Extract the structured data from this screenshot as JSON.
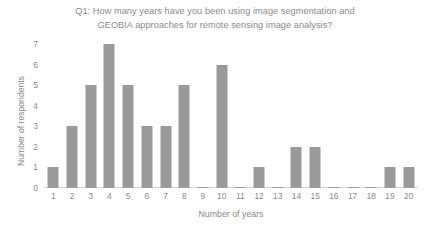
{
  "chart_data": {
    "type": "bar",
    "title": "Q1: How many years have you been using image segmentation and GEOBIA approaches for remote sensing image analysis?",
    "title_lines": [
      "Q1: How many years have you been using image segmentation and",
      "GEOBIA approaches for remote sensing image analysis?"
    ],
    "xlabel": "Number of years",
    "ylabel": "Number of respondents",
    "categories": [
      "1",
      "2",
      "3",
      "4",
      "5",
      "6",
      "7",
      "8",
      "9",
      "10",
      "11",
      "12",
      "13",
      "14",
      "15",
      "16",
      "17",
      "18",
      "19",
      "20"
    ],
    "values": [
      1,
      3,
      5,
      7,
      5,
      3,
      3,
      5,
      0,
      6,
      0,
      1,
      0,
      2,
      2,
      0,
      0,
      0,
      1,
      1
    ],
    "ylim": [
      0,
      7
    ],
    "y_ticks": [
      "0",
      "1",
      "2",
      "3",
      "4",
      "5",
      "6",
      "7"
    ],
    "grid": false,
    "legend": false,
    "bar_color": "#9a9a9a",
    "text_color": "#8a8a8a",
    "axis_color": "#d6d6d6",
    "background": "#ffffff"
  }
}
